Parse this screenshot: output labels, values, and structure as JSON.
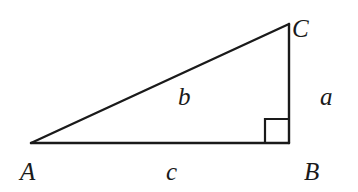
{
  "diagram": {
    "type": "right-triangle",
    "vertices": {
      "A": "A",
      "B": "B",
      "C": "C"
    },
    "sides": {
      "a": "a",
      "b": "b",
      "c": "c"
    },
    "right_angle_at": "B",
    "side_descriptions": {
      "a": "leg BC (opposite A)",
      "b": "hypotenuse AC (opposite B)",
      "c": "leg AB (opposite C)"
    },
    "colors": {
      "stroke": "#1a1a1a",
      "background": "#ffffff"
    }
  }
}
